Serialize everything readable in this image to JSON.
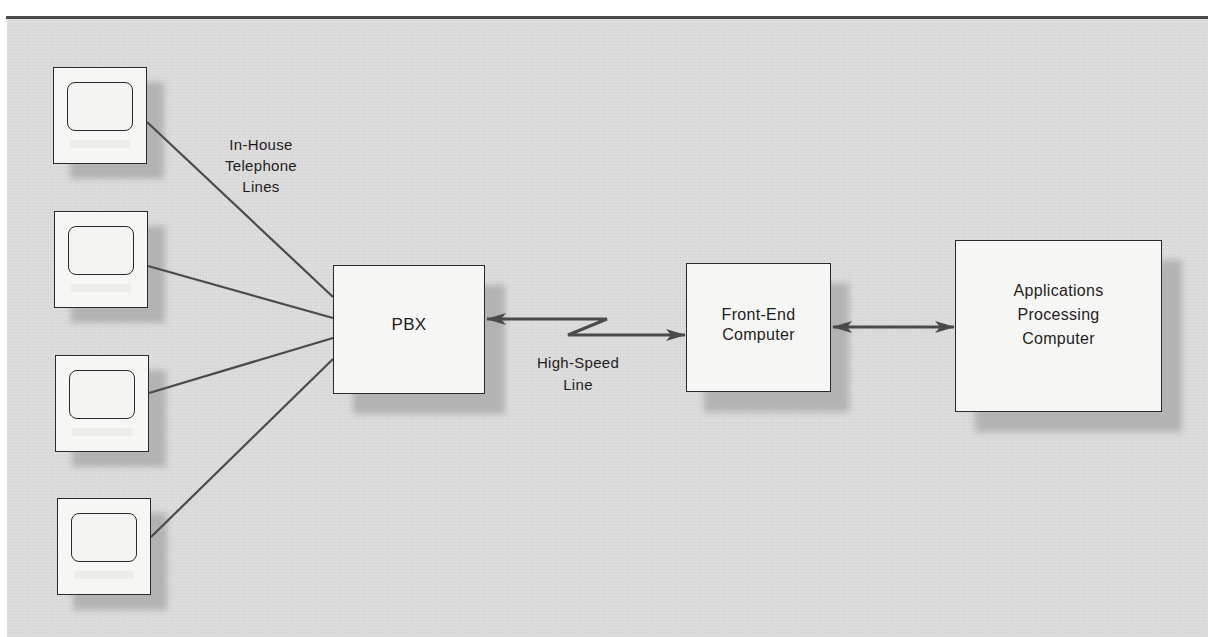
{
  "diagram": {
    "type": "network-topology",
    "nodes": {
      "terminals": [
        {
          "id": "terminal-1",
          "icon": "terminal-icon"
        },
        {
          "id": "terminal-2",
          "icon": "terminal-icon"
        },
        {
          "id": "terminal-3",
          "icon": "terminal-icon"
        },
        {
          "id": "terminal-4",
          "icon": "terminal-icon"
        }
      ],
      "pbx": {
        "label": "PBX"
      },
      "front_end": {
        "label_line1": "Front-End",
        "label_line2": "Computer"
      },
      "applications": {
        "label_line1": "Applications",
        "label_line2": "Processing",
        "label_line3": "Computer"
      }
    },
    "edge_labels": {
      "telephone_lines": {
        "line1": "In-House",
        "line2": "Telephone",
        "line3": "Lines"
      },
      "high_speed_line": {
        "line1": "High-Speed",
        "line2": "Line"
      }
    },
    "edges": [
      {
        "from": "terminal-1",
        "to": "PBX",
        "label": "In-House Telephone Lines"
      },
      {
        "from": "terminal-2",
        "to": "PBX"
      },
      {
        "from": "terminal-3",
        "to": "PBX"
      },
      {
        "from": "terminal-4",
        "to": "PBX"
      },
      {
        "from": "PBX",
        "to": "Front-End Computer",
        "label": "High-Speed Line",
        "style": "bidirectional-zigzag"
      },
      {
        "from": "Front-End Computer",
        "to": "Applications Processing Computer",
        "style": "bidirectional"
      }
    ],
    "colors": {
      "background": "#dcdcdc",
      "box_fill": "#f6f6f4",
      "stroke": "#2a2a2a",
      "line": "#4a4a4a"
    }
  }
}
